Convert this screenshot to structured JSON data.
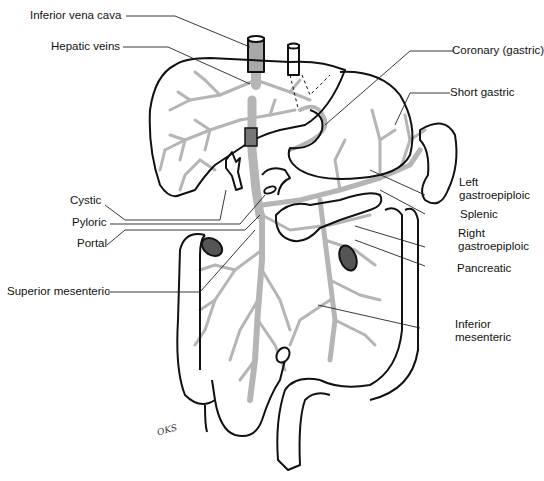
{
  "diagram": {
    "colors": {
      "outline": "#111111",
      "vessels": "#b5b5b5",
      "leaders": "#222222",
      "background": "#ffffff"
    },
    "labels_left": [
      {
        "id": "inferior-vena-cava",
        "text": "Inferior vena cava"
      },
      {
        "id": "hepatic-veins",
        "text": "Hepatic veins"
      },
      {
        "id": "cystic",
        "text": "Cystic"
      },
      {
        "id": "pyloric",
        "text": "Pyloric"
      },
      {
        "id": "portal",
        "text": "Portal"
      },
      {
        "id": "superior-mesenteric",
        "text": "Superior mesenteric"
      }
    ],
    "labels_right": [
      {
        "id": "coronary-gastric",
        "text": "Coronary (gastric)"
      },
      {
        "id": "short-gastric",
        "text": "Short gastric"
      },
      {
        "id": "left-gastroepiploic",
        "line1": "Left",
        "line2": "gastroepiploic"
      },
      {
        "id": "splenic",
        "text": "Splenic"
      },
      {
        "id": "right-gastroepiploic",
        "line1": "Right",
        "line2": "gastroepiploic"
      },
      {
        "id": "pancreatic",
        "text": "Pancreatic"
      },
      {
        "id": "inferior-mesenteric",
        "line1": "Inferior",
        "line2": "mesenteric"
      }
    ],
    "signature": "OKS"
  }
}
